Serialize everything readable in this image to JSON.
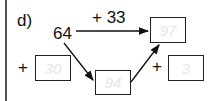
{
  "exercise": {
    "label": "d)",
    "start_number": "64",
    "top_operation": "+ 33",
    "result_box": "97",
    "left_plus": "+",
    "left_box": "30",
    "middle_box": "94",
    "right_plus": "+",
    "right_box": "3"
  }
}
